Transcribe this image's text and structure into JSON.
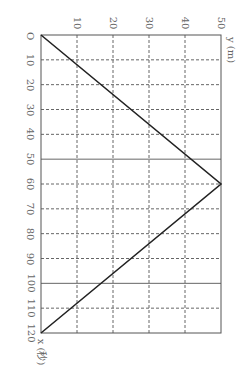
{
  "chart_data": {
    "type": "line",
    "title": "",
    "xlabel": "x (秒)",
    "ylabel": "y (m)",
    "x_ticks": [
      10,
      20,
      30,
      40,
      50,
      60,
      70,
      80,
      90,
      100,
      110,
      120
    ],
    "y_ticks": [
      10,
      20,
      30,
      40,
      50
    ],
    "origin_label": "O",
    "xlim": [
      0,
      120
    ],
    "ylim": [
      0,
      50
    ],
    "grid": true,
    "orientation": "rotated 90deg clockwise",
    "series": [
      {
        "name": "y vs x",
        "x": [
          0,
          60,
          120
        ],
        "y": [
          0,
          50,
          0
        ]
      }
    ]
  },
  "labels": {
    "origin": "O",
    "x_axis": "x (秒)",
    "y_axis": "y (m)",
    "x_ticks": [
      "10",
      "20",
      "30",
      "40",
      "50",
      "60",
      "70",
      "80",
      "90",
      "100",
      "110",
      "120"
    ],
    "y_ticks": [
      "10",
      "20",
      "30",
      "40",
      "50"
    ]
  }
}
